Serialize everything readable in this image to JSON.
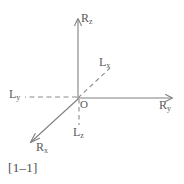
{
  "figure": {
    "caption": "[1–1]",
    "origin_label": "O",
    "stroke_color": "#808080",
    "text_color": "#5a5a5a",
    "background_color": "#ffffff",
    "axes": [
      {
        "id": "Rz",
        "base": "R",
        "subscript": "z",
        "label": "R",
        "sub": "z",
        "style": "solid",
        "direction": "up",
        "arrow": true
      },
      {
        "id": "Ry",
        "base": "R",
        "subscript": "y",
        "label": "R",
        "sub": "y",
        "style": "solid",
        "direction": "right",
        "arrow": true
      },
      {
        "id": "Rx",
        "base": "R",
        "subscript": "x",
        "label": "R",
        "sub": "x",
        "style": "solid",
        "direction": "down-left",
        "arrow": true
      },
      {
        "id": "Lx",
        "base": "L",
        "subscript": "x",
        "label": "L",
        "sub": "x",
        "style": "dashed",
        "direction": "up-right",
        "arrow": false
      },
      {
        "id": "Ly",
        "base": "L",
        "subscript": "y",
        "label": "L",
        "sub": "y",
        "style": "dashed",
        "direction": "left",
        "arrow": false
      },
      {
        "id": "Lz",
        "base": "L",
        "subscript": "z",
        "label": "L",
        "sub": "z",
        "style": "dashed",
        "direction": "down",
        "arrow": false
      }
    ]
  }
}
